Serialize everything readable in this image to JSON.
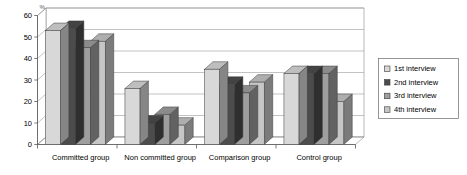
{
  "chart_data": {
    "type": "bar",
    "title": "",
    "subtitle": "",
    "xlabel": "",
    "ylabel": "%",
    "ylim": [
      0,
      60
    ],
    "ytick_step": 10,
    "yticks": [
      "0",
      "10",
      "20",
      "30",
      "40",
      "50",
      "60"
    ],
    "grid": true,
    "style": "3d-clustered-column",
    "legend_position": "right",
    "categories": [
      "Committed group",
      "Non committed group",
      "Comparison group",
      "Control group"
    ],
    "series": [
      {
        "name": "1st interview",
        "color": "#d8d8d8",
        "values": [
          53,
          26,
          35,
          33
        ]
      },
      {
        "name": "2nd interview",
        "color": "#4c4c4c",
        "values": [
          54,
          10,
          28,
          33
        ]
      },
      {
        "name": "3rd interview",
        "color": "#9e9e9e",
        "values": [
          45,
          14,
          24,
          33
        ]
      },
      {
        "name": "4th interview",
        "color": "#c6c6c6",
        "values": [
          48,
          9,
          29,
          20
        ]
      }
    ]
  },
  "legend": {
    "entries": [
      {
        "label": "1st interview"
      },
      {
        "label": "2nd interview"
      },
      {
        "label": "3rd interview"
      },
      {
        "label": "4th interview"
      }
    ]
  },
  "axis": {
    "unit_label": "%"
  }
}
